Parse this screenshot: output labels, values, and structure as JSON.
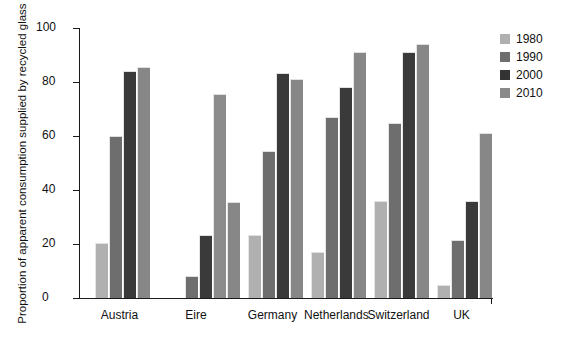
{
  "chart_data": {
    "type": "bar",
    "title": "",
    "xlabel": "",
    "ylabel": "Proportion of apparent consumption supplied by recycled glass (%)",
    "ylim": [
      0,
      100
    ],
    "yticks": [
      0,
      20,
      40,
      60,
      80,
      100
    ],
    "grid": false,
    "legend_position": "right-top",
    "categories": [
      "Austria",
      "Eire",
      "Germany",
      "Netherlands",
      "Switzerland",
      "UK"
    ],
    "series": [
      {
        "name": "1980",
        "color": "#b0b0b0",
        "values": [
          20.5,
          0,
          23.5,
          17,
          36,
          5
        ]
      },
      {
        "name": "1990",
        "color": "#6e6e6e",
        "values": [
          60,
          8,
          54.5,
          67,
          65,
          21.5
        ]
      },
      {
        "name": "2000",
        "color": "#3a3a3a",
        "values": [
          84,
          23.5,
          83.5,
          78,
          91,
          36
        ]
      },
      {
        "name": "2010",
        "color": "#878787",
        "values": [
          85.5,
          35.5,
          81,
          91,
          94,
          61
        ]
      }
    ],
    "extra_bars": [
      {
        "category": "Eire",
        "series": "2010-outline",
        "value": 75.5,
        "color": "#8c8c8c"
      }
    ]
  },
  "ytick_labels": [
    "0",
    "20",
    "40",
    "60",
    "80",
    "100"
  ],
  "legend": {
    "items": [
      {
        "label": "1980",
        "color": "#b0b0b0"
      },
      {
        "label": "1990",
        "color": "#6e6e6e"
      },
      {
        "label": "2000",
        "color": "#333333"
      },
      {
        "label": "2010",
        "color": "#8a8a8a"
      }
    ]
  },
  "caption": {
    "fragment": ""
  }
}
